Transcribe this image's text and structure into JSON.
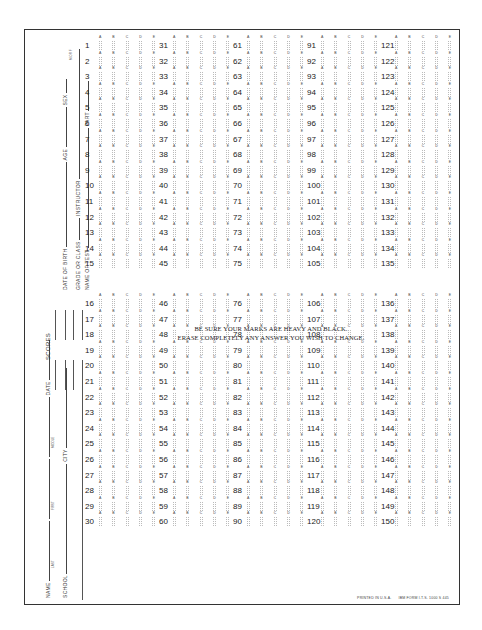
{
  "form": {
    "header": {
      "scores_label": "SCORES",
      "fields": {
        "name": "NAME",
        "name_sub": [
          "LAST",
          "FIRST",
          "MIDDLE"
        ],
        "date": "DATE",
        "school": "SCHOOL",
        "city": "CITY",
        "date_of_birth": "DATE OF BIRTH",
        "age": "AGE",
        "sex": "SEX",
        "sex_sub": "M OR F",
        "grade_or_class": "GRADE OR CLASS",
        "instructor": "INSTRUCTOR",
        "name_of_test": "NAME OF TEST",
        "part": "PART"
      },
      "score_slots": [
        "1",
        "2",
        "3",
        "4",
        "5",
        "6",
        "7",
        "8"
      ]
    },
    "choices": [
      "A",
      "B",
      "C",
      "D",
      "E"
    ],
    "columns": [
      {
        "start": 1,
        "end": 30
      },
      {
        "start": 31,
        "end": 60
      },
      {
        "start": 61,
        "end": 90
      },
      {
        "start": 91,
        "end": 120
      },
      {
        "start": 121,
        "end": 150
      }
    ],
    "instructions": {
      "line1": "BE SURE YOUR MARKS ARE HEAVY AND BLACK.",
      "line2": "ERASE COMPLETELY ANY ANSWER YOU WISH TO CHANGE."
    },
    "footer": {
      "printed": "PRINTED IN U.S.A.",
      "form_id": "IBM FORM I.T.S. 1000 S 445"
    }
  }
}
